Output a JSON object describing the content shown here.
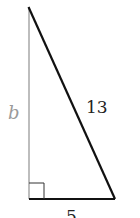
{
  "diagram": {
    "type": "right-triangle",
    "labels": {
      "vertical_side": "b",
      "hypotenuse": "13",
      "base": "5"
    },
    "colors": {
      "vertical_side": "#9a9a9a",
      "hypotenuse": "#111111",
      "base": "#111111",
      "label_b": "#9a9a9a",
      "label_text": "#222222"
    },
    "right_angle_marker": true
  }
}
